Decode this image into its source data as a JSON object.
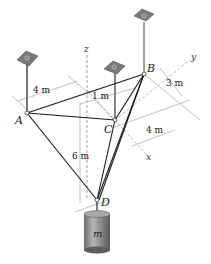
{
  "figure": {
    "points": {
      "A": {
        "label": "A"
      },
      "B": {
        "label": "B"
      },
      "C": {
        "label": "C"
      },
      "D": {
        "label": "D"
      }
    },
    "axes": {
      "x": "x",
      "y": "y",
      "z": "z"
    },
    "dimensions": {
      "ab_width": "4 m",
      "c_offset": "1 m",
      "b_offset": "3 m",
      "c_depth": "4 m",
      "height": "6 m"
    },
    "mass_label": "m",
    "colors": {
      "cable": "#1a1a1a",
      "support_plate": "#7a7a7a",
      "dim_line": "#888888",
      "cylinder": "#8c8c8c"
    }
  }
}
